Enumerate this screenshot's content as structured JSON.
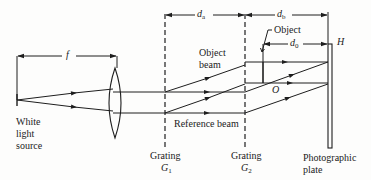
{
  "diagram": {
    "colors": {
      "ink": "#1e1e1e",
      "background": "#fdfdfc"
    },
    "labels": {
      "focal_length": "f",
      "d_a": "d",
      "d_a_sub": "a",
      "d_b": "d",
      "d_b_sub": "b",
      "d_0": "d",
      "d_0_sub": "0",
      "hologram": "H",
      "object_callout": "Object",
      "object_point": "O",
      "object_beam_line1": "Object",
      "object_beam_line2": "beam",
      "reference_beam": "Reference beam",
      "source_line1": "White",
      "source_line2": "light",
      "source_line3": "source",
      "grating1_name": "Grating",
      "grating1_symbol": "G",
      "grating1_sub": "1",
      "grating2_name": "Grating",
      "grating2_symbol": "G",
      "grating2_sub": "2",
      "plate_line1": "Photographic",
      "plate_line2": "plate"
    }
  }
}
